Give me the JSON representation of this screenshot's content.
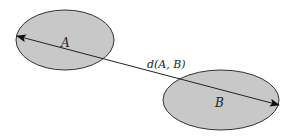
{
  "diagram": {
    "sets": [
      {
        "id": "A",
        "label": "A"
      },
      {
        "id": "B",
        "label": "B"
      }
    ],
    "distance_label": "d(A, B)",
    "colors": {
      "fill": "#c8c8c8",
      "stroke": "#333333",
      "line": "#222222",
      "background": "#ffffff"
    }
  }
}
